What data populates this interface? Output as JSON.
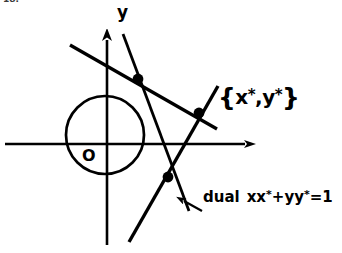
{
  "figure": {
    "background_color": "#ffffff",
    "ink_color": "#000000",
    "width": 342,
    "height": 253
  },
  "axes": {
    "origin_label": "O",
    "y_axis_label": "y",
    "x_axis": {
      "x1": 5,
      "y1": 144,
      "x2": 258,
      "y2": 144,
      "arrow": "right"
    },
    "y_axis": {
      "x1": 107,
      "y1": 245,
      "x2": 107,
      "y2": 27,
      "arrow": "up"
    }
  },
  "circle": {
    "cx": 105,
    "cy": 135,
    "r": 39,
    "name": "unit-circle"
  },
  "points": {
    "external": {
      "x": 199,
      "y": 113,
      "label": "{x*,y*}"
    },
    "tangency_upper": {
      "x": 138,
      "y": 79
    },
    "tangency_lower": {
      "x": 168,
      "y": 177
    }
  },
  "labels": {
    "point_brace_open": "{",
    "point_x": "x",
    "point_star1": "*",
    "point_comma": ",",
    "point_y": "y",
    "point_star2": "*",
    "point_brace_close": "}",
    "dual_word": "dual",
    "dual_eq_xx": "xx",
    "dual_star1": "*",
    "dual_plus": "+",
    "dual_eq_yy": "yy",
    "dual_star2": "*",
    "dual_equals": "=1",
    "corner_artifact": "18."
  },
  "lines": [
    {
      "name": "tangent-upper",
      "from": [
        73,
        47
      ],
      "to": [
        215,
        128
      ]
    },
    {
      "name": "tangent-lower",
      "from": [
        130,
        241
      ],
      "to": [
        216,
        88
      ]
    },
    {
      "name": "dual-chord-of-contact",
      "from": [
        124,
        35
      ],
      "to": [
        188,
        208
      ]
    }
  ],
  "annotation_arrow": {
    "name": "dual-callout-arrow",
    "from": [
      200,
      210
    ],
    "to": [
      180,
      200
    ]
  }
}
